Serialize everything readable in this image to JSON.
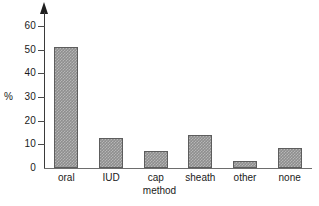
{
  "chart_data": {
    "type": "bar",
    "title": "",
    "xlabel": "method",
    "ylabel": "%",
    "categories": [
      "oral",
      "IUD",
      "cap",
      "sheath",
      "other",
      "none"
    ],
    "values": [
      51,
      12.5,
      7,
      14,
      3,
      8.5
    ],
    "ylim": [
      0,
      65
    ],
    "yticks": [
      0,
      10,
      20,
      30,
      40,
      50,
      60
    ],
    "ytick_labels": [
      "0",
      "10",
      "20",
      "30",
      "40",
      "50",
      "60"
    ],
    "grid": false,
    "legend": null,
    "bar_color": "#8e8e8e",
    "bar_edge_color": "#5d5d5d",
    "axis_color": "#3a3a3a"
  },
  "figure": {
    "y_axis_caption": "%",
    "x_axis_caption": "method",
    "bottom_sliver_text": ""
  }
}
